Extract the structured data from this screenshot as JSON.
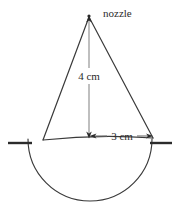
{
  "diagram": {
    "canvas": {
      "width": 177,
      "height": 213
    },
    "colors": {
      "background": "#ffffff",
      "outline": "#3a3a3a",
      "dimension_line": "#6e6e6e",
      "ground_line": "#2b2b2b",
      "text": "#2b2b2b"
    },
    "labels": {
      "nozzle": "nozzle",
      "height": "4 cm",
      "radius": "3 cm"
    },
    "geometry": {
      "apex": {
        "x": 89,
        "y": 16
      },
      "base_left": {
        "x": 43,
        "y": 140
      },
      "base_right": {
        "x": 153,
        "y": 138
      },
      "base_center": {
        "x": 90,
        "y": 139
      },
      "hemisphere_radius": 62,
      "hemisphere_bottom_y": 201,
      "ground_y": 143,
      "ground_left_from_x": 8,
      "ground_left_to_x": 32,
      "ground_right_from_x": 150,
      "ground_right_to_x": 172
    },
    "measurements": {
      "cone_height_cm": 4,
      "cone_radius_cm": 3
    },
    "icons": {
      "arrow_down": "arrow-down-icon",
      "arrow_left": "arrow-left-icon",
      "arrow_right": "arrow-right-icon"
    }
  }
}
